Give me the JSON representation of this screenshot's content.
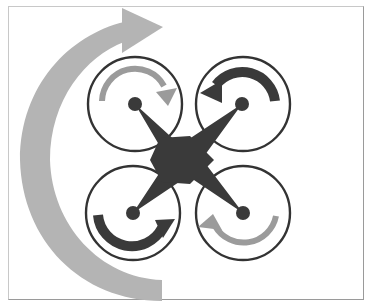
{
  "diagram": {
    "title": "",
    "colors": {
      "body": "#3a3a3a",
      "light_arrow": "#9b9b9b",
      "yaw_arrow": "#b4b4b4",
      "ring": "#333333",
      "background": "#ffffff",
      "frame_border": "#b0b0b0"
    },
    "rotors": [
      {
        "id": "front-left",
        "direction": "clockwise",
        "arrow_shade": "light"
      },
      {
        "id": "front-right",
        "direction": "counter-clockwise",
        "arrow_shade": "dark"
      },
      {
        "id": "rear-left",
        "direction": "counter-clockwise",
        "arrow_shade": "dark"
      },
      {
        "id": "rear-right",
        "direction": "clockwise",
        "arrow_shade": "light"
      }
    ],
    "yaw_arrow": {
      "direction": "clockwise",
      "label": ""
    }
  }
}
